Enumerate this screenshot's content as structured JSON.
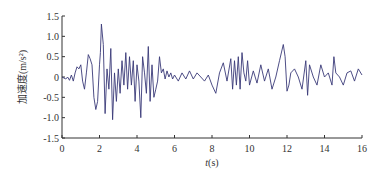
{
  "chart_data": {
    "type": "line",
    "title": "",
    "xlabel": "t(s)",
    "ylabel": "加速度(m/s²)",
    "xlim": [
      0,
      16
    ],
    "ylim": [
      -1.5,
      1.5
    ],
    "xticks": [
      0,
      2,
      4,
      6,
      8,
      10,
      12,
      14,
      16
    ],
    "yticks": [
      1.5,
      1.0,
      0.5,
      0,
      -0.5,
      -1.0,
      -1.5
    ],
    "ytick_labels": [
      "1.5",
      "1.0",
      "0.5",
      "0",
      "-0.5",
      "-1.0",
      "-1.5"
    ],
    "xtick_labels": [
      "0",
      "2",
      "4",
      "6",
      "8",
      "10",
      "12",
      "14",
      "16"
    ],
    "grid": false,
    "legend": null,
    "line_color": "#3a3a78",
    "series": [
      {
        "name": "acceleration",
        "x": [
          0.0,
          0.2,
          0.3,
          0.4,
          0.5,
          0.6,
          0.7,
          0.8,
          0.9,
          1.0,
          1.1,
          1.2,
          1.3,
          1.4,
          1.5,
          1.6,
          1.7,
          1.8,
          1.9,
          2.0,
          2.05,
          2.1,
          2.2,
          2.3,
          2.4,
          2.5,
          2.6,
          2.7,
          2.8,
          2.9,
          3.0,
          3.1,
          3.2,
          3.3,
          3.4,
          3.5,
          3.6,
          3.7,
          3.8,
          3.9,
          4.0,
          4.1,
          4.2,
          4.3,
          4.4,
          4.5,
          4.6,
          4.7,
          4.8,
          4.9,
          5.0,
          5.1,
          5.2,
          5.3,
          5.4,
          5.5,
          5.6,
          5.7,
          5.8,
          5.9,
          6.0,
          6.2,
          6.4,
          6.6,
          6.8,
          7.0,
          7.2,
          7.4,
          7.6,
          7.8,
          8.0,
          8.2,
          8.4,
          8.6,
          8.8,
          9.0,
          9.1,
          9.2,
          9.3,
          9.4,
          9.5,
          9.6,
          9.7,
          9.8,
          9.9,
          10.0,
          10.2,
          10.4,
          10.6,
          10.8,
          11.0,
          11.2,
          11.4,
          11.6,
          11.8,
          11.9,
          12.0,
          12.1,
          12.2,
          12.4,
          12.6,
          12.8,
          13.0,
          13.1,
          13.2,
          13.4,
          13.6,
          13.8,
          14.0,
          14.2,
          14.4,
          14.5,
          14.6,
          14.8,
          15.0,
          15.2,
          15.4,
          15.6,
          15.8,
          16.0
        ],
        "values": [
          0.0,
          -0.05,
          0.0,
          -0.08,
          0.05,
          -0.1,
          0.1,
          0.25,
          0.2,
          0.3,
          -0.1,
          -0.3,
          0.1,
          0.55,
          0.45,
          0.3,
          -0.5,
          -0.8,
          -0.6,
          0.3,
          0.6,
          1.3,
          0.8,
          -0.9,
          0.2,
          -0.3,
          0.7,
          -1.05,
          0.1,
          -0.6,
          0.2,
          -0.4,
          0.4,
          -0.2,
          0.6,
          -0.3,
          0.5,
          -0.2,
          0.4,
          -0.6,
          0.3,
          -0.1,
          -1.0,
          0.5,
          0.1,
          -0.4,
          0.75,
          -0.6,
          0.3,
          -0.5,
          -0.3,
          -0.1,
          0.5,
          0.1,
          0.2,
          -0.05,
          0.15,
          0.0,
          0.1,
          -0.05,
          0.05,
          -0.1,
          0.1,
          -0.05,
          0.15,
          -0.05,
          0.1,
          0.0,
          -0.1,
          0.05,
          -0.2,
          -0.4,
          0.1,
          0.35,
          -0.1,
          0.45,
          -0.3,
          0.4,
          -0.2,
          0.5,
          -0.3,
          0.6,
          0.1,
          -0.1,
          0.4,
          -0.2,
          0.15,
          -0.15,
          0.3,
          -0.1,
          0.2,
          -0.3,
          0.0,
          0.4,
          0.8,
          0.5,
          -0.35,
          -0.2,
          0.1,
          0.2,
          0.0,
          -0.3,
          0.4,
          -0.45,
          0.3,
          0.0,
          -0.2,
          0.3,
          0.0,
          0.1,
          -0.2,
          0.5,
          0.1,
          0.0,
          -0.2,
          0.1,
          0.15,
          -0.1,
          0.2,
          0.05
        ]
      }
    ]
  }
}
